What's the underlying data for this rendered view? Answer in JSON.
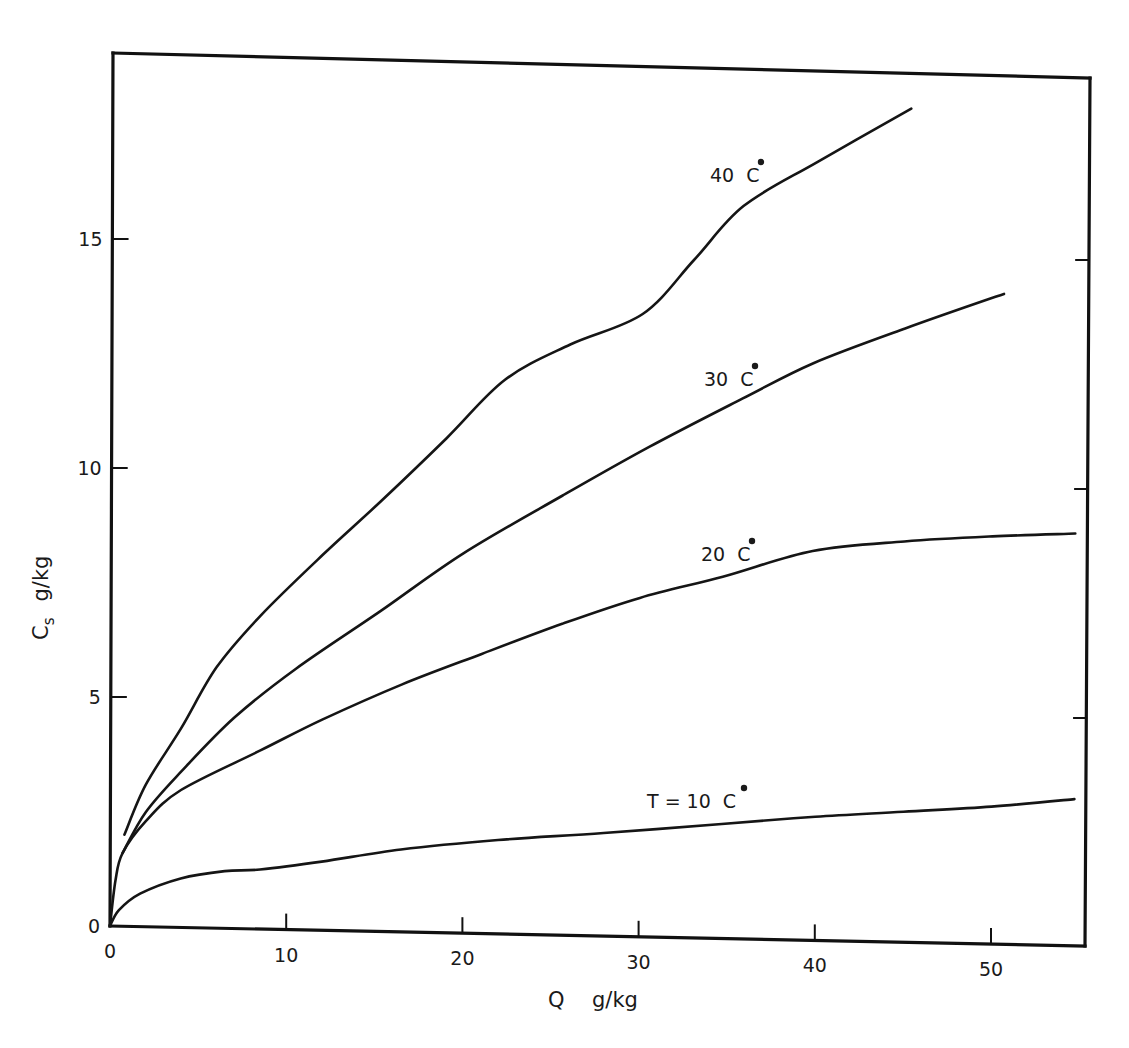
{
  "chart_data": {
    "type": "line",
    "title": "",
    "xlabel": "Q   g/kg",
    "ylabel": "Cs   g/kg",
    "xlabel_parts": {
      "symbol": "Q",
      "unit": "g/kg"
    },
    "ylabel_parts": {
      "symbol": "C",
      "subscript": "s",
      "unit": "g/kg"
    },
    "xlim": [
      0,
      55
    ],
    "ylim": [
      0,
      19
    ],
    "x_ticks": [
      0,
      10,
      20,
      30,
      40,
      50
    ],
    "y_ticks": [
      0,
      5,
      10,
      15
    ],
    "x_tick_labels": [
      "0",
      "10",
      "20",
      "30",
      "40",
      "50"
    ],
    "y_tick_labels": [
      "0",
      "5",
      "10",
      "15"
    ],
    "grid": false,
    "legend": "inline labels on curves",
    "series": [
      {
        "name": "40 °C",
        "label": "40",
        "label_suffix": "C",
        "x": [
          0.8,
          2,
          4,
          6,
          8.5,
          12,
          15.3,
          19,
          22.3,
          26,
          30.1,
          33,
          35.8,
          40,
          45.3
        ],
        "values": [
          2.0,
          3.1,
          4.35,
          5.7,
          6.85,
          8.2,
          9.4,
          10.8,
          12.1,
          12.9,
          13.6,
          14.8,
          16.0,
          17.0,
          18.2
        ]
      },
      {
        "name": "30 °C",
        "label": "30",
        "label_suffix": "C",
        "x": [
          0.7,
          2,
          4,
          7,
          10.5,
          15.3,
          20,
          25.6,
          30.5,
          35.8,
          39.8,
          45,
          50.6
        ],
        "values": [
          1.6,
          2.5,
          3.4,
          4.6,
          5.7,
          7.0,
          8.3,
          9.6,
          10.7,
          11.8,
          12.6,
          13.4,
          14.2
        ]
      },
      {
        "name": "20 °C",
        "label": "20",
        "label_suffix": "C",
        "x": [
          0,
          0.3,
          0.7,
          2,
          4,
          8.5,
          12,
          16.5,
          21,
          25.6,
          30,
          34.7,
          39.8,
          45,
          50,
          54.7
        ],
        "values": [
          0,
          1.0,
          1.6,
          2.3,
          3.0,
          3.9,
          4.6,
          5.4,
          6.1,
          6.8,
          7.4,
          7.9,
          8.5,
          8.75,
          8.9,
          9.0
        ]
      },
      {
        "name": "T = 10 °C",
        "label": "T = 10",
        "label_suffix": "C",
        "x": [
          0,
          0.5,
          1.7,
          4,
          6.5,
          8.5,
          12,
          16.5,
          22,
          28,
          34.7,
          40,
          45,
          50,
          54.7
        ],
        "values": [
          0,
          0.35,
          0.72,
          1.07,
          1.25,
          1.3,
          1.5,
          1.8,
          2.05,
          2.25,
          2.5,
          2.7,
          2.85,
          3.0,
          3.2
        ]
      }
    ],
    "series_label_positions": [
      {
        "series": "40 °C",
        "x_px": 710,
        "y_px": 182
      },
      {
        "series": "30 °C",
        "x_px": 704,
        "y_px": 386
      },
      {
        "series": "20 °C",
        "x_px": 701,
        "y_px": 561
      },
      {
        "series": "T = 10 °C",
        "x_px": 647,
        "y_px": 808
      }
    ]
  }
}
